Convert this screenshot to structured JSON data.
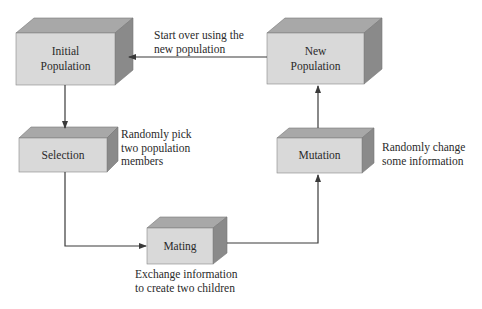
{
  "colors": {
    "front": "#d9d9d9",
    "top": "#a8a8a8",
    "side": "#8a8a8a",
    "edge": "#666666",
    "line": "#3a3a3a"
  },
  "boxes": {
    "initial_population": {
      "label": "Initial\nPopulation"
    },
    "new_population": {
      "label": "New\nPopulation"
    },
    "selection": {
      "label": "Selection"
    },
    "mutation": {
      "label": "Mutation"
    },
    "mating": {
      "label": "Mating"
    }
  },
  "annotations": {
    "start_over": "Start over using the\nnew population",
    "selection_note": "Randomly pick\ntwo population\nmembers",
    "mutation_note": "Randomly change\nsome information",
    "mating_note": "Exchange information\nto create two children"
  }
}
